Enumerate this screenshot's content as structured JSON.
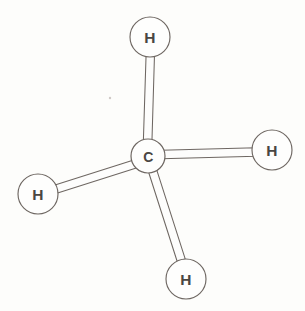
{
  "figure": {
    "canvas": {
      "width": 305,
      "height": 311
    },
    "background_color": "#fdfdfb",
    "stroke_color": "#6e6762",
    "label_color": "#4a4642",
    "fill_color": "#fefefd"
  },
  "atoms": [
    {
      "id": "carbon-center",
      "element": "C",
      "label": "C",
      "cx": 148,
      "cy": 156,
      "r": 17,
      "role": "central-atom"
    },
    {
      "id": "hydrogen-top",
      "element": "H",
      "label": "H",
      "cx": 150,
      "cy": 37,
      "r": 20,
      "role": "terminal-atom"
    },
    {
      "id": "hydrogen-right",
      "element": "H",
      "label": "H",
      "cx": 272,
      "cy": 150,
      "r": 20,
      "role": "terminal-atom"
    },
    {
      "id": "hydrogen-left",
      "element": "H",
      "label": "H",
      "cx": 38,
      "cy": 194,
      "r": 20,
      "role": "terminal-atom"
    },
    {
      "id": "hydrogen-bottom",
      "element": "H",
      "label": "H",
      "cx": 186,
      "cy": 279,
      "r": 20,
      "role": "terminal-atom"
    }
  ],
  "bonds": [
    {
      "id": "bond-c-h-top",
      "from": "carbon-center",
      "to": "hydrogen-top",
      "style": "tube",
      "x1": 147,
      "y1": 152,
      "x2": 150,
      "y2": 52,
      "width": 9
    },
    {
      "id": "bond-c-h-right",
      "from": "carbon-center",
      "to": "hydrogen-right",
      "style": "tube",
      "x1": 152,
      "y1": 155,
      "x2": 256,
      "y2": 152,
      "width": 9
    },
    {
      "id": "bond-c-h-left",
      "from": "carbon-center",
      "to": "hydrogen-left",
      "style": "tube",
      "x1": 144,
      "y1": 160,
      "x2": 54,
      "y2": 189,
      "width": 9
    },
    {
      "id": "bond-c-h-bottom",
      "from": "carbon-center",
      "to": "hydrogen-bottom",
      "style": "tube",
      "x1": 151,
      "y1": 168,
      "x2": 181,
      "y2": 262,
      "width": 9
    }
  ],
  "artifacts": [
    {
      "id": "scan-speck",
      "cx": 110,
      "cy": 98,
      "r": 1.2
    }
  ]
}
